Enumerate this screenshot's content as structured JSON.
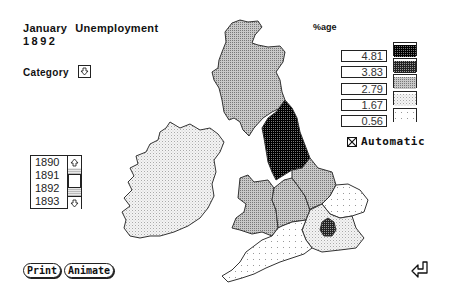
{
  "header": {
    "title_month": "January",
    "title_subject": "Unemployment",
    "year": "1892"
  },
  "category": {
    "label": "Category",
    "button_icon": "down-arrow-icon"
  },
  "legend": {
    "heading": "%age",
    "values": [
      "4.81",
      "3.83",
      "2.79",
      "1.67",
      "0.56"
    ],
    "swatch_patterns": [
      "black-dense",
      "dark-dots",
      "medium-gray",
      "light-dots",
      "sparse-dots"
    ],
    "automatic": {
      "label": "Automatic",
      "checked": true
    }
  },
  "year_list": {
    "items": [
      "1890",
      "1891",
      "1892",
      "1893"
    ],
    "selected": "1892",
    "scroll_up_icon": "up-arrow-icon",
    "scroll_down_icon": "down-arrow-icon"
  },
  "buttons": {
    "print": "Print",
    "animate": "Animate",
    "return_icon": "return-arrow-icon"
  },
  "map": {
    "regions": [
      {
        "name": "Scotland",
        "shade": "medium-gray"
      },
      {
        "name": "Ireland",
        "shade": "light-dots"
      },
      {
        "name": "North England",
        "shade": "black-dense"
      },
      {
        "name": "Wales",
        "shade": "medium-gray"
      },
      {
        "name": "West Midlands",
        "shade": "medium-gray"
      },
      {
        "name": "East Midlands",
        "shade": "medium-gray"
      },
      {
        "name": "East Anglia",
        "shade": "sparse-dots"
      },
      {
        "name": "South East",
        "shade": "light-dots"
      },
      {
        "name": "London",
        "shade": "dark-dots"
      },
      {
        "name": "South West",
        "shade": "sparse-dots"
      }
    ]
  }
}
